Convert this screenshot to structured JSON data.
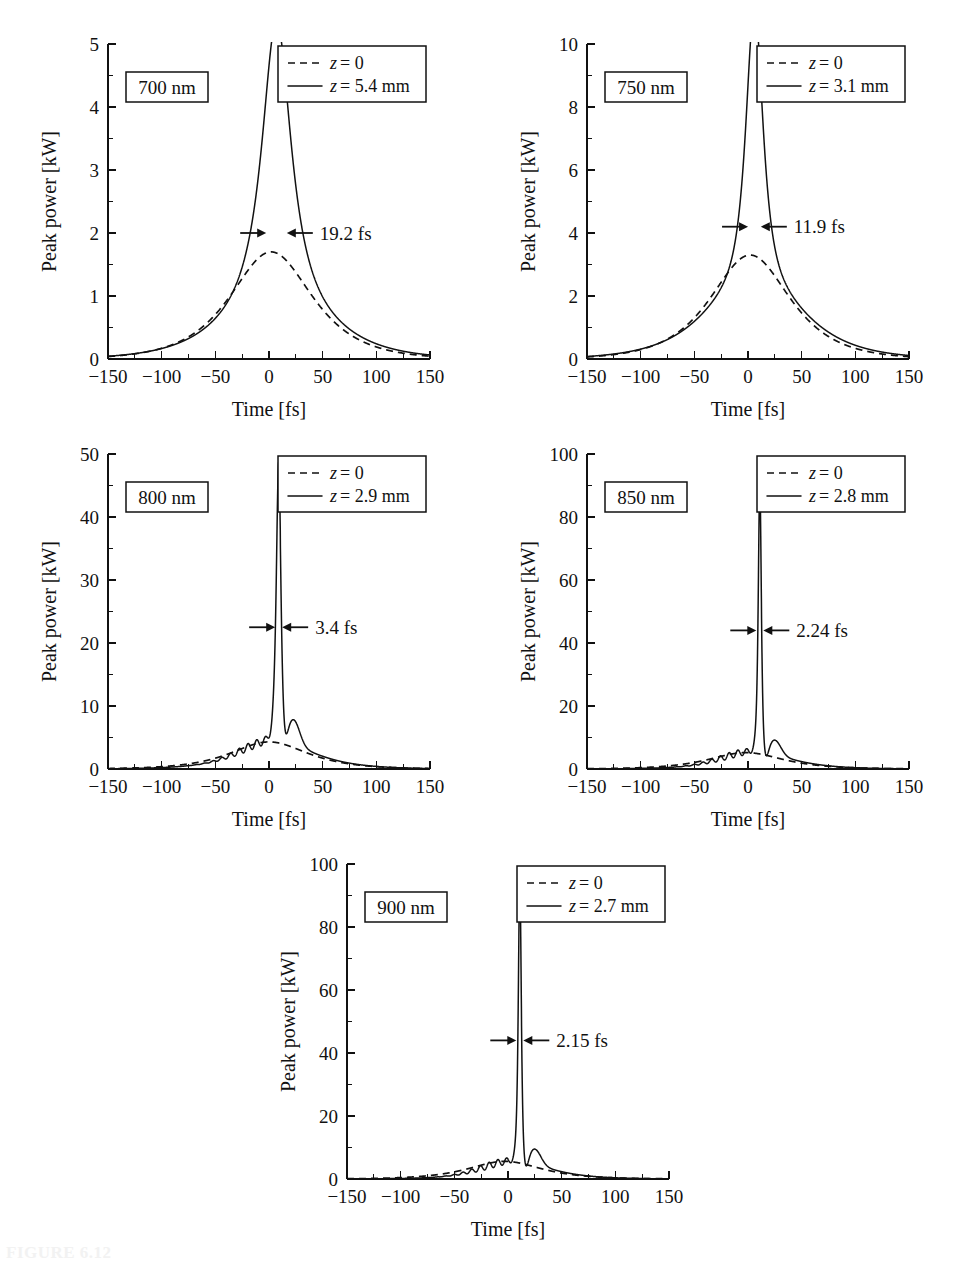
{
  "figure": {
    "caption": "FIGURE 6.12",
    "panel_count": 5,
    "ink_color": "#111111",
    "background_color": "#ffffff"
  },
  "axis_titles": {
    "x": "Time [fs]",
    "y": "Peak power [kW]"
  },
  "legend_labels": {
    "dashed_prefix": "z",
    "dashed_value": "= 0",
    "solid_prefix": "z"
  },
  "chart_data": [
    {
      "type": "line",
      "title": "700 nm",
      "xlabel": "Time [fs]",
      "ylabel": "Peak power [kW]",
      "xlim": [
        -150,
        150
      ],
      "ylim": [
        0,
        5
      ],
      "xticks": [
        -150,
        -100,
        -50,
        0,
        50,
        100,
        150
      ],
      "xticklabels": [
        "−150",
        "−100",
        "−50",
        "0",
        "50",
        "100",
        "150"
      ],
      "yticks": [
        0,
        1,
        2,
        3,
        4,
        5
      ],
      "yticklabels": [
        "0",
        "1",
        "2",
        "3",
        "4",
        "5"
      ],
      "minor_x_step": 25,
      "minor_y_step": 0.5,
      "grid": false,
      "legend_position": "upper-right",
      "wavelength_label": "700 nm",
      "annotation": "19.2 fs",
      "annotation_y": 2.0,
      "peak_center": 7,
      "series": [
        {
          "name": "z = 0",
          "style": "dashed",
          "peak": 1.7,
          "center": 2,
          "width": 62,
          "shape": "sech_broad"
        },
        {
          "name": "z = 5.4 mm",
          "style": "solid",
          "peak": 3.92,
          "center": 7,
          "fwhm_fs": 19.2,
          "pedestal_peak": 1.45,
          "pedestal_width": 72,
          "shape": "spike_on_pedestal",
          "ripple": 0
        }
      ]
    },
    {
      "type": "line",
      "title": "750 nm",
      "xlabel": "Time [fs]",
      "ylabel": "Peak power [kW]",
      "xlim": [
        -150,
        150
      ],
      "ylim": [
        0,
        10
      ],
      "xticks": [
        -150,
        -100,
        -50,
        0,
        50,
        100,
        150
      ],
      "xticklabels": [
        "−150",
        "−100",
        "−50",
        "0",
        "50",
        "100",
        "150"
      ],
      "yticks": [
        0,
        2,
        4,
        6,
        8,
        10
      ],
      "yticklabels": [
        "0",
        "2",
        "4",
        "6",
        "8",
        "10"
      ],
      "minor_x_step": 25,
      "minor_y_step": 1,
      "grid": false,
      "legend_position": "upper-right",
      "wavelength_label": "750 nm",
      "annotation": "11.9 fs",
      "annotation_y": 4.2,
      "peak_center": 6,
      "series": [
        {
          "name": "z = 0",
          "style": "dashed",
          "peak": 3.3,
          "center": 2,
          "width": 60,
          "shape": "sech_broad"
        },
        {
          "name": "z = 3.1 mm",
          "style": "solid",
          "peak": 8.3,
          "center": 6,
          "fwhm_fs": 11.9,
          "pedestal_peak": 2.9,
          "pedestal_width": 70,
          "shape": "spike_on_pedestal",
          "ripple": 0
        }
      ]
    },
    {
      "type": "line",
      "title": "800 nm",
      "xlabel": "Time [fs]",
      "ylabel": "Peak power [kW]",
      "xlim": [
        -150,
        150
      ],
      "ylim": [
        0,
        50
      ],
      "xticks": [
        -150,
        -100,
        -50,
        0,
        50,
        100,
        150
      ],
      "xticklabels": [
        "−150",
        "−100",
        "−50",
        "0",
        "50",
        "100",
        "150"
      ],
      "yticks": [
        0,
        10,
        20,
        30,
        40,
        50
      ],
      "yticklabels": [
        "0",
        "10",
        "20",
        "30",
        "40",
        "50"
      ],
      "minor_x_step": 25,
      "minor_y_step": 5,
      "grid": false,
      "legend_position": "upper-right",
      "wavelength_label": "800 nm",
      "annotation": "3.4 fs",
      "annotation_y": 22.5,
      "peak_center": 9,
      "series": [
        {
          "name": "z = 0",
          "style": "dashed",
          "peak": 4.3,
          "center": 0,
          "width": 58,
          "shape": "sech_broad"
        },
        {
          "name": "z = 2.9 mm",
          "style": "solid",
          "peak": 44.5,
          "center": 9,
          "fwhm_fs": 3.4,
          "pedestal_peak": 4.2,
          "pedestal_width": 58,
          "shape": "spike_on_pedestal",
          "ripple": 1
        }
      ]
    },
    {
      "type": "line",
      "title": "850 nm",
      "xlabel": "Time [fs]",
      "ylabel": "Peak power [kW]",
      "xlim": [
        -150,
        150
      ],
      "ylim": [
        0,
        100
      ],
      "xticks": [
        -150,
        -100,
        -50,
        0,
        50,
        100,
        150
      ],
      "xticklabels": [
        "−150",
        "−100",
        "−50",
        "0",
        "50",
        "100",
        "150"
      ],
      "yticks": [
        0,
        20,
        40,
        60,
        80,
        100
      ],
      "yticklabels": [
        "0",
        "20",
        "40",
        "60",
        "80",
        "100"
      ],
      "minor_x_step": 25,
      "minor_y_step": 10,
      "grid": false,
      "legend_position": "upper-right",
      "wavelength_label": "850 nm",
      "annotation": "2.24 fs",
      "annotation_y": 44,
      "peak_center": 11,
      "series": [
        {
          "name": "z = 0",
          "style": "dashed",
          "peak": 5.2,
          "center": -2,
          "width": 56,
          "shape": "sech_broad"
        },
        {
          "name": "z = 2.8 mm",
          "style": "solid",
          "peak": 86,
          "center": 11,
          "fwhm_fs": 2.24,
          "pedestal_peak": 5.0,
          "pedestal_width": 54,
          "shape": "spike_on_pedestal",
          "ripple": 2
        }
      ]
    },
    {
      "type": "line",
      "title": "900 nm",
      "xlabel": "Time [fs]",
      "ylabel": "Peak power [kW]",
      "xlim": [
        -150,
        150
      ],
      "ylim": [
        0,
        100
      ],
      "xticks": [
        -150,
        -100,
        -50,
        0,
        50,
        100,
        150
      ],
      "xticklabels": [
        "−150",
        "−100",
        "−50",
        "0",
        "50",
        "100",
        "150"
      ],
      "yticks": [
        0,
        20,
        40,
        60,
        80,
        100
      ],
      "yticklabels": [
        "0",
        "20",
        "40",
        "60",
        "80",
        "100"
      ],
      "minor_x_step": 25,
      "minor_y_step": 10,
      "grid": false,
      "legend_position": "upper-right",
      "wavelength_label": "900 nm",
      "annotation": "2.15 fs",
      "annotation_y": 44,
      "peak_center": 11,
      "series": [
        {
          "name": "z = 0",
          "style": "dashed",
          "peak": 5.6,
          "center": -3,
          "width": 55,
          "shape": "sech_broad"
        },
        {
          "name": "z = 2.7 mm",
          "style": "solid",
          "peak": 91,
          "center": 11,
          "fwhm_fs": 2.15,
          "pedestal_peak": 5.2,
          "pedestal_width": 52,
          "shape": "spike_on_pedestal",
          "ripple": 2
        }
      ]
    }
  ]
}
